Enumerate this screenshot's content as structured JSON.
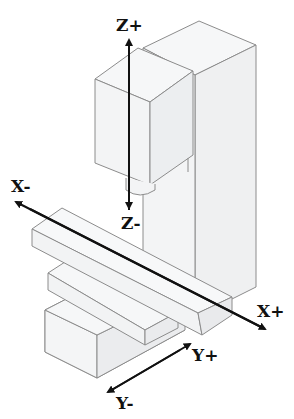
{
  "diagram": {
    "labels": {
      "z_plus": "Z+",
      "z_minus": "Z-",
      "x_minus": "X-",
      "x_plus": "X+",
      "y_plus": "Y+",
      "y_minus": "Y-"
    },
    "components": [
      "column",
      "spindle-head",
      "spindle",
      "table",
      "saddle",
      "base"
    ],
    "colors": {
      "fill": "#f4f5f6",
      "fill_dark": "#e9eaec",
      "edge": "#8c8c8c",
      "arrow": "#111111"
    }
  }
}
